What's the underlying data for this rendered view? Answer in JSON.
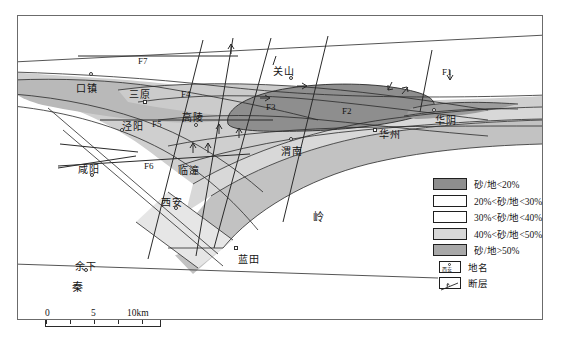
{
  "figure": {
    "type": "geological-sand-ratio-map",
    "region": "Guanzhong Basin"
  },
  "places": [
    {
      "name": "口镇",
      "x": 76,
      "y": 71,
      "marker": "circle",
      "mx": 89,
      "my": 60
    },
    {
      "name": "三原",
      "x": 128,
      "y": 79,
      "marker": "square",
      "mx": 143,
      "my": 89
    },
    {
      "name": "泾阳",
      "x": 121,
      "y": 114,
      "marker": "circle",
      "mx": 119,
      "my": 120
    },
    {
      "name": "高陵",
      "x": 181,
      "y": 105,
      "marker": "circle",
      "mx": 193,
      "my": 116
    },
    {
      "name": "关山",
      "x": 272,
      "y": 60,
      "marker": "circle",
      "mx": 288,
      "my": 71
    },
    {
      "name": "咸阳",
      "x": 77,
      "y": 158,
      "marker": "circle",
      "mx": 89,
      "my": 168
    },
    {
      "name": "临潼",
      "x": 177,
      "y": 158,
      "marker": "circle",
      "mx": 189,
      "my": 165
    },
    {
      "name": "西安",
      "x": 160,
      "y": 190,
      "marker": "circle",
      "mx": 173,
      "my": 200
    },
    {
      "name": "渭南",
      "x": 280,
      "y": 139,
      "marker": "circle",
      "mx": 288,
      "my": 132
    },
    {
      "name": "华州",
      "x": 378,
      "y": 122,
      "marker": "square",
      "mx": 372,
      "my": 121
    },
    {
      "name": "华阴",
      "x": 434,
      "y": 108,
      "marker": "circle",
      "mx": 431,
      "my": 104
    },
    {
      "name": "蓝田",
      "x": 237,
      "y": 247,
      "marker": "square",
      "mx": 233,
      "my": 243
    },
    {
      "name": "余下",
      "x": 74,
      "y": 254,
      "marker": "circle",
      "mx": 83,
      "my": 263
    }
  ],
  "range_labels": [
    {
      "text": "秦",
      "x": 71,
      "y": 276
    },
    {
      "text": "岭",
      "x": 312,
      "y": 204
    }
  ],
  "faults": [
    {
      "label": "F1",
      "x": 441,
      "y": 68
    },
    {
      "label": "F2",
      "x": 341,
      "y": 102
    },
    {
      "label": "F3",
      "x": 265,
      "y": 97
    },
    {
      "label": "F4",
      "x": 180,
      "y": 86
    },
    {
      "label": "F5",
      "x": 151,
      "y": 117
    },
    {
      "label": "F6",
      "x": 143,
      "y": 158
    },
    {
      "label": "F7",
      "x": 137,
      "y": 53
    }
  ],
  "scalebar": {
    "ticks": [
      {
        "label": "0",
        "pos": 0
      },
      {
        "label": "5",
        "pos": 48
      },
      {
        "label": "10km",
        "pos": 95
      }
    ],
    "segment_positions": [
      0,
      24,
      48,
      72,
      96,
      115
    ]
  },
  "legend": {
    "entries": [
      {
        "label": "砂/地<20%",
        "kind": "swatch",
        "fill": "#8e8e8e"
      },
      {
        "label": "20%<砂/地<30%",
        "kind": "swatch",
        "fill": "#ffffff"
      },
      {
        "label": "30%<砂/地<40%",
        "kind": "swatch",
        "fill": "#ffffff"
      },
      {
        "label": "40%<砂/地<50%",
        "kind": "swatch",
        "fill": "#d8d8d8"
      },
      {
        "label": "砂/地>50%",
        "kind": "swatch",
        "fill": "#a8a8a8"
      },
      {
        "label": "地名",
        "kind": "place-symbol",
        "symbol_text": "西安"
      },
      {
        "label": "断层",
        "kind": "fault-symbol"
      }
    ]
  },
  "colors": {
    "fill_lt20": "#8e8e8e",
    "fill_20_30": "#ffffff",
    "fill_30_40": "#ffffff",
    "fill_40_50": "#d8d8d8",
    "fill_gt50": "#a8a8a8",
    "band_mid": "#c2c2c2",
    "line": "#2a2a2a",
    "frame": "#6b6b6b"
  }
}
